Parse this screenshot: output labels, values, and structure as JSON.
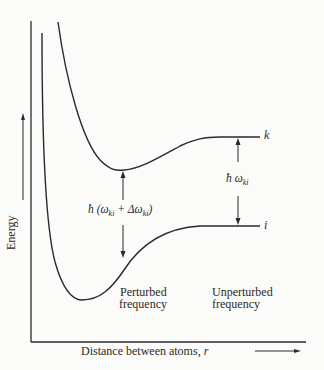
{
  "diagram": {
    "y_axis_label": "Energy",
    "x_axis_label": "Distance between atoms, r",
    "x_axis_label_text": "Distance between atoms, ",
    "x_axis_label_var": "r",
    "upper_state_label": "k",
    "lower_state_label": "i",
    "perturbed_label": "ħ (ωₖᵢ + Δωₖᵢ)",
    "perturbed_h": "ħ",
    "perturbed_expr": "(ω",
    "perturbed_sub1": "ki",
    "perturbed_plus": " + Δω",
    "perturbed_sub2": "ki",
    "perturbed_close": ")",
    "unperturbed_label_h": "ħ ω",
    "unperturbed_sub": "ki",
    "perturbed_caption_line1": "Perturbed",
    "perturbed_caption_line2": "frequency",
    "unperturbed_caption_line1": "Unperturbed",
    "unperturbed_caption_line2": "frequency",
    "line_color": "#2a2a2a"
  }
}
